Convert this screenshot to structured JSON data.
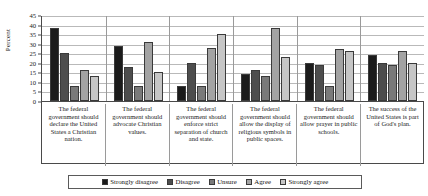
{
  "chart_data": {
    "type": "bar",
    "title": "",
    "xlabel": "",
    "ylabel": "Percent",
    "ylim": [
      0,
      45
    ],
    "ytick_step": 5,
    "yticks": [
      45,
      40,
      35,
      30,
      25,
      20,
      15,
      10,
      5,
      0
    ],
    "grid": true,
    "legend_position": "bottom",
    "orientation": "vertical",
    "grouping": "grouped",
    "categories": [
      "The federal government should declare the United States a Christian nation.",
      "The federal government should advocate Christian values.",
      "The federal government should enforce strict separation of church and state.",
      "The federal government should allow the display of religious symbols in public spaces.",
      "The federal government should allow prayer in public schools.",
      "The success of the United States is part of God's plan."
    ],
    "series": [
      {
        "name": "Strongly disagree",
        "color": "#1b1b1b",
        "values": [
          38,
          29,
          8,
          14,
          20,
          24
        ]
      },
      {
        "name": "Disagree",
        "color": "#4d4d4d",
        "values": [
          25,
          18,
          20,
          16,
          19,
          20
        ]
      },
      {
        "name": "Unsure",
        "color": "#7a7a7a",
        "values": [
          8,
          8,
          8,
          13,
          8,
          19
        ]
      },
      {
        "name": "Agree",
        "color": "#a3a3a3",
        "values": [
          16,
          31,
          28,
          38,
          27,
          26
        ]
      },
      {
        "name": "Strongly agree",
        "color": "#c6c6c6",
        "values": [
          13,
          15,
          35,
          23,
          26,
          20
        ]
      }
    ]
  }
}
